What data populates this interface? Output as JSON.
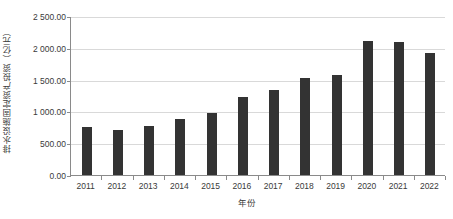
{
  "chart_data": {
    "type": "bar",
    "title": "",
    "xlabel": "年份",
    "ylabel": "排水设施固定资产投资（亿元）",
    "categories": [
      "2011",
      "2012",
      "2013",
      "2014",
      "2015",
      "2016",
      "2017",
      "2018",
      "2019",
      "2020",
      "2021",
      "2022"
    ],
    "values": [
      750.0,
      700.0,
      770.0,
      885.0,
      980.0,
      1220.0,
      1340.0,
      1525.0,
      1565.0,
      2115.0,
      2085.0,
      1915.0
    ],
    "ylim": [
      0,
      2500
    ],
    "ytick_values": [
      0,
      500,
      1000,
      1500,
      2000,
      2500
    ],
    "ytick_labels": [
      "0.00",
      "500.00",
      "1 000.00",
      "1 500.00",
      "2 000.00",
      "2 500.00"
    ],
    "grid": true,
    "legend": "none",
    "series_color": "#333333",
    "gridline_color": "#d9d9d9",
    "axis_color": "#8a8a8a"
  }
}
